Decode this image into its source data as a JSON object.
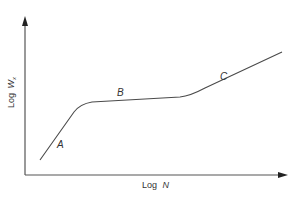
{
  "figure": {
    "x_axis_label": {
      "prefix": "Log ",
      "var": "N"
    },
    "y_axis_label": {
      "prefix": "Log ",
      "var": "W",
      "sub": "x"
    },
    "segments": [
      {
        "id": "A",
        "label": "A"
      },
      {
        "id": "B",
        "label": "B"
      },
      {
        "id": "C",
        "label": "C"
      }
    ],
    "colors": {
      "axis": "#555555",
      "curve": "#4a4a4a",
      "text": "#333333",
      "background": "#ffffff"
    }
  }
}
